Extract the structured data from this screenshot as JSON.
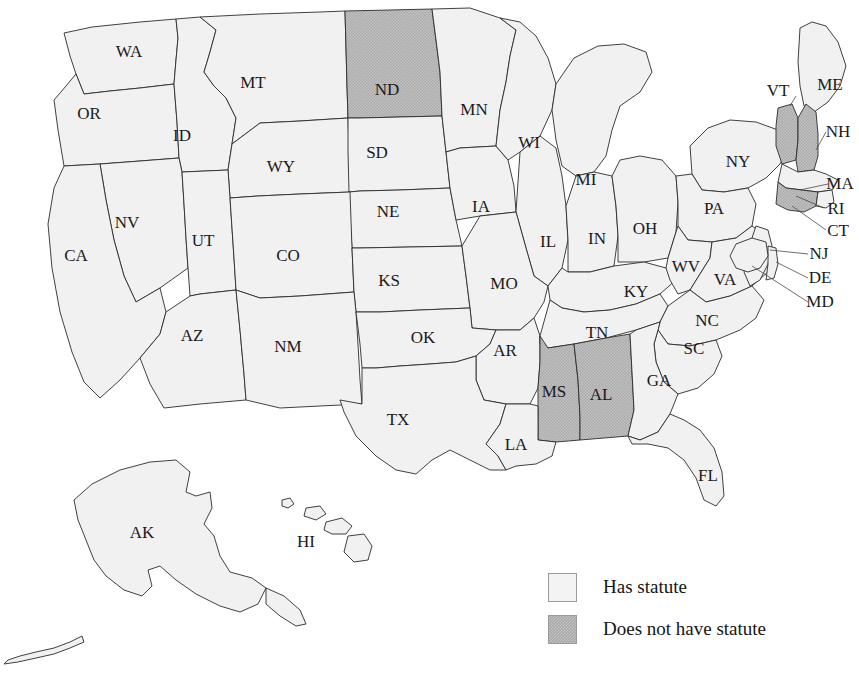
{
  "legend": {
    "items": [
      {
        "key": "has",
        "label": "Has statute",
        "color": "#f1f1f1"
      },
      {
        "key": "hasnot",
        "label": "Does not have statute",
        "color": "#a9a9a9"
      }
    ]
  },
  "chart_data": {
    "type": "map",
    "title": "",
    "region": "United States",
    "categories": [
      "Has statute",
      "Does not have statute"
    ],
    "colors": {
      "Has statute": "#f1f1f1",
      "Does not have statute": "#a9a9a9"
    },
    "legend_position": "bottom-right",
    "values": {
      "AL": "Does not have statute",
      "AK": "Has statute",
      "AZ": "Has statute",
      "AR": "Has statute",
      "CA": "Has statute",
      "CO": "Has statute",
      "CT": "Does not have statute",
      "DE": "Has statute",
      "FL": "Has statute",
      "GA": "Has statute",
      "HI": "Has statute",
      "ID": "Has statute",
      "IL": "Has statute",
      "IN": "Has statute",
      "IA": "Has statute",
      "KS": "Has statute",
      "KY": "Has statute",
      "LA": "Has statute",
      "ME": "Has statute",
      "MD": "Has statute",
      "MA": "Has statute",
      "MI": "Has statute",
      "MN": "Has statute",
      "MS": "Does not have statute",
      "MO": "Has statute",
      "MT": "Has statute",
      "NE": "Has statute",
      "NV": "Has statute",
      "NH": "Does not have statute",
      "NJ": "Has statute",
      "NM": "Has statute",
      "NY": "Has statute",
      "NC": "Has statute",
      "ND": "Does not have statute",
      "OH": "Has statute",
      "OK": "Has statute",
      "OR": "Has statute",
      "PA": "Has statute",
      "RI": "Has statute",
      "SC": "Has statute",
      "SD": "Has statute",
      "TN": "Has statute",
      "TX": "Has statute",
      "UT": "Has statute",
      "VT": "Does not have statute",
      "VA": "Has statute",
      "WA": "Has statute",
      "WV": "Has statute",
      "WI": "Has statute",
      "WY": "Has statute"
    },
    "counts": {
      "Has statute": 44,
      "Does not have statute": 6
    }
  },
  "map": {
    "labels": [
      {
        "id": "WA",
        "text": "WA",
        "x": 129,
        "y": 53
      },
      {
        "id": "OR",
        "text": "OR",
        "x": 89,
        "y": 115
      },
      {
        "id": "ID",
        "text": "ID",
        "x": 182,
        "y": 137
      },
      {
        "id": "MT",
        "text": "MT",
        "x": 253,
        "y": 84
      },
      {
        "id": "WY",
        "text": "WY",
        "x": 281,
        "y": 168
      },
      {
        "id": "ND",
        "text": "ND",
        "x": 387,
        "y": 91
      },
      {
        "id": "SD",
        "text": "SD",
        "x": 377,
        "y": 154
      },
      {
        "id": "NE",
        "text": "NE",
        "x": 388,
        "y": 213
      },
      {
        "id": "MN",
        "text": "MN",
        "x": 474,
        "y": 111
      },
      {
        "id": "IA",
        "text": "IA",
        "x": 481,
        "y": 208
      },
      {
        "id": "WI",
        "text": "WI",
        "x": 529,
        "y": 144
      },
      {
        "id": "MI",
        "text": "MI",
        "x": 586,
        "y": 181
      },
      {
        "id": "IL",
        "text": "IL",
        "x": 548,
        "y": 243
      },
      {
        "id": "IN",
        "text": "IN",
        "x": 597,
        "y": 240
      },
      {
        "id": "OH",
        "text": "OH",
        "x": 645,
        "y": 230
      },
      {
        "id": "NY",
        "text": "NY",
        "x": 738,
        "y": 163
      },
      {
        "id": "PA",
        "text": "PA",
        "x": 714,
        "y": 210
      },
      {
        "id": "NV",
        "text": "NV",
        "x": 127,
        "y": 224
      },
      {
        "id": "CA",
        "text": "CA",
        "x": 76,
        "y": 257
      },
      {
        "id": "UT",
        "text": "UT",
        "x": 203,
        "y": 242
      },
      {
        "id": "CO",
        "text": "CO",
        "x": 288,
        "y": 257
      },
      {
        "id": "KS",
        "text": "KS",
        "x": 389,
        "y": 282
      },
      {
        "id": "MO",
        "text": "MO",
        "x": 504,
        "y": 285
      },
      {
        "id": "KY",
        "text": "KY",
        "x": 636,
        "y": 293
      },
      {
        "id": "WV",
        "text": "WV",
        "x": 686,
        "y": 268
      },
      {
        "id": "VA",
        "text": "VA",
        "x": 725,
        "y": 281
      },
      {
        "id": "AZ",
        "text": "AZ",
        "x": 192,
        "y": 337
      },
      {
        "id": "NM",
        "text": "NM",
        "x": 288,
        "y": 348
      },
      {
        "id": "OK",
        "text": "OK",
        "x": 423,
        "y": 339
      },
      {
        "id": "AR",
        "text": "AR",
        "x": 505,
        "y": 352
      },
      {
        "id": "TN",
        "text": "TN",
        "x": 597,
        "y": 334
      },
      {
        "id": "NC",
        "text": "NC",
        "x": 707,
        "y": 322
      },
      {
        "id": "SC",
        "text": "SC",
        "x": 694,
        "y": 350
      },
      {
        "id": "MS",
        "text": "MS",
        "x": 554,
        "y": 393
      },
      {
        "id": "AL",
        "text": "AL",
        "x": 601,
        "y": 396
      },
      {
        "id": "GA",
        "text": "GA",
        "x": 659,
        "y": 382
      },
      {
        "id": "TX",
        "text": "TX",
        "x": 398,
        "y": 421
      },
      {
        "id": "LA",
        "text": "LA",
        "x": 516,
        "y": 446
      },
      {
        "id": "FL",
        "text": "FL",
        "x": 708,
        "y": 477
      },
      {
        "id": "AK",
        "text": "AK",
        "x": 142,
        "y": 534
      },
      {
        "id": "HI",
        "text": "HI",
        "x": 306,
        "y": 543
      },
      {
        "id": "VT",
        "text": "VT",
        "x": 778,
        "y": 92
      },
      {
        "id": "ME",
        "text": "ME",
        "x": 830,
        "y": 86
      },
      {
        "id": "NH",
        "text": "NH",
        "x": 838,
        "y": 133
      },
      {
        "id": "MA",
        "text": "MA",
        "x": 840,
        "y": 185
      },
      {
        "id": "RI",
        "text": "RI",
        "x": 836,
        "y": 210
      },
      {
        "id": "CT",
        "text": "CT",
        "x": 838,
        "y": 232
      },
      {
        "id": "NJ",
        "text": "NJ",
        "x": 819,
        "y": 255
      },
      {
        "id": "DE",
        "text": "DE",
        "x": 820,
        "y": 279
      },
      {
        "id": "MD",
        "text": "MD",
        "x": 820,
        "y": 303
      }
    ]
  }
}
